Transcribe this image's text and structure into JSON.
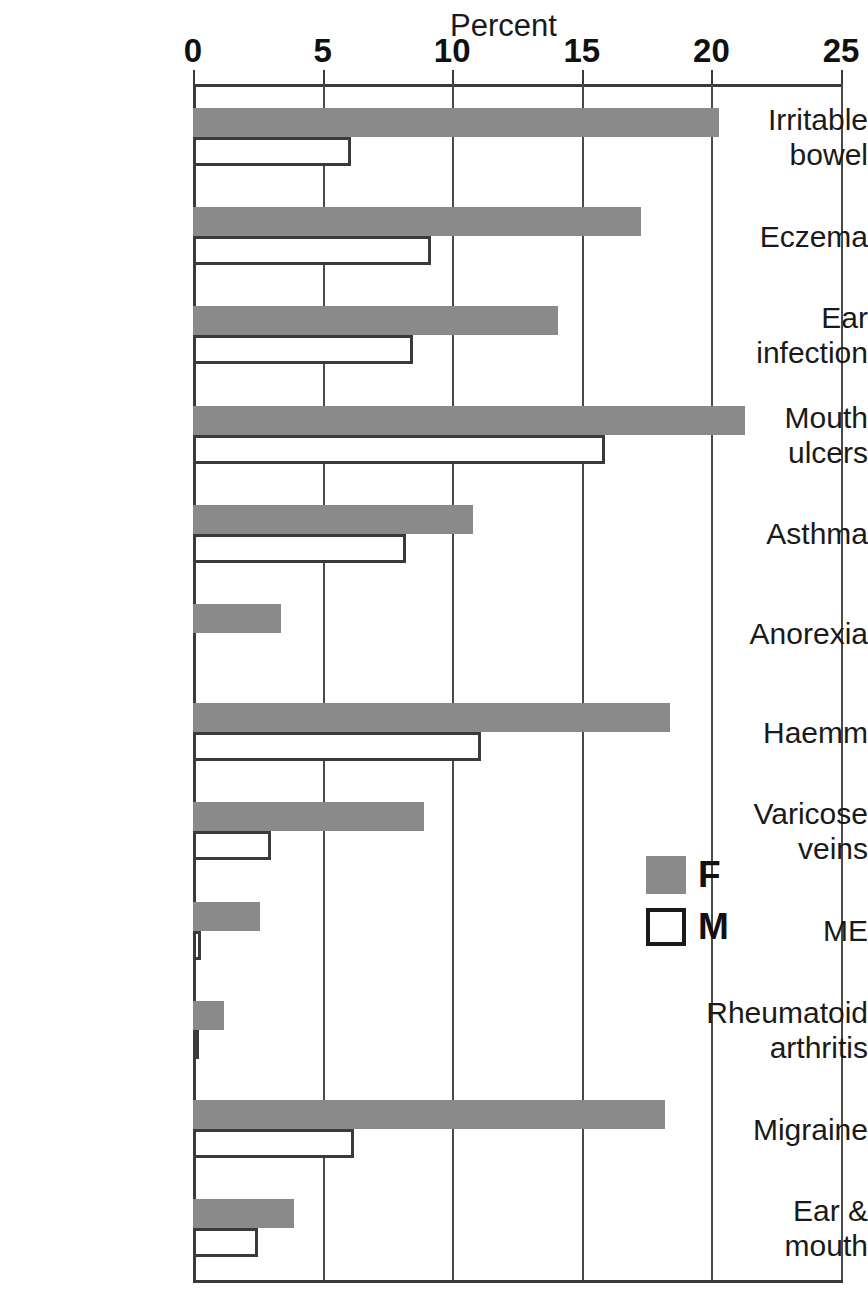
{
  "chart_data": {
    "type": "bar",
    "orientation": "horizontal",
    "title": "",
    "xlabel": "Percent",
    "ylabel": "",
    "xlim": [
      0,
      25
    ],
    "xticks": [
      0,
      5,
      10,
      15,
      20,
      25
    ],
    "xticklabels": [
      "0",
      "5",
      "10",
      "15",
      "20",
      "25"
    ],
    "grid": true,
    "grid_axis": "x",
    "legend_position": "right-middle",
    "categories": [
      "Irritable\nbowel",
      "Eczema",
      "Ear\ninfection",
      "Mouth\nulcers",
      "Asthma",
      "Anorexia",
      "Haemm",
      "Varicose\nveins",
      "ME",
      "Rheumatoid\narthritis",
      "Migraine",
      "Ear &\nmouth"
    ],
    "series": [
      {
        "name": "F",
        "color": "#8a8a8a",
        "style": "filled",
        "values": [
          20.3,
          17.3,
          14.1,
          21.3,
          10.8,
          3.4,
          18.4,
          8.9,
          2.6,
          1.2,
          18.2,
          3.9
        ]
      },
      {
        "name": "M",
        "color": "#ffffff",
        "style": "outlined",
        "values": [
          6.1,
          9.2,
          8.5,
          15.9,
          8.2,
          0.0,
          11.1,
          3.0,
          0.3,
          0.2,
          6.2,
          2.5
        ]
      }
    ]
  },
  "legend": {
    "items": [
      {
        "label": "F",
        "swatch": "filled-gray"
      },
      {
        "label": "M",
        "swatch": "outlined-white"
      }
    ]
  },
  "colors": {
    "female_bar": "#8a8a8a",
    "male_bar_fill": "#ffffff",
    "male_bar_stroke": "#3a3a3a",
    "axis": "#3a3a3a",
    "text": "#1a1a1a",
    "background": "#ffffff"
  }
}
